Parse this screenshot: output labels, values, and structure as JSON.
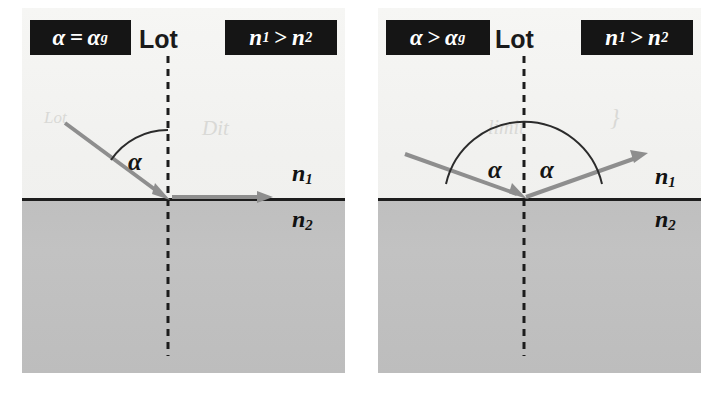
{
  "figure": {
    "background_color": "#ffffff",
    "paper_color": "#f2f2f0",
    "medium2_color": "#c0c0c0",
    "ray_color": "#8e8e8e",
    "badge_bg": "#151515",
    "badge_fg": "#ffffff",
    "ink_color": "#1a1a1a"
  },
  "panels": [
    {
      "id": "left",
      "name": "critical-angle-panel",
      "condition_badge": {
        "symbol": "α",
        "operator": "=",
        "reference": "α",
        "reference_sub": "g",
        "text": "α = αg"
      },
      "index_badge": {
        "left": "n",
        "left_sub": "1",
        "operator": ">",
        "right": "n",
        "right_sub": "2",
        "text": "n1 > n2"
      },
      "normal_label": "Lot",
      "medium_upper_label": "n",
      "medium_upper_sub": "1",
      "medium_lower_label": "n",
      "medium_lower_sub": "2",
      "angle_labels": [
        "α"
      ],
      "rays": [
        {
          "role": "incident-ray",
          "direction": "down-right"
        },
        {
          "role": "refracted-ray-grazing",
          "direction": "right-along-interface"
        }
      ],
      "ghost_text": [
        "Dit",
        "Lot"
      ]
    },
    {
      "id": "right",
      "name": "total-internal-reflection-panel",
      "condition_badge": {
        "symbol": "α",
        "operator": ">",
        "reference": "α",
        "reference_sub": "g",
        "text": "α > αg"
      },
      "index_badge": {
        "left": "n",
        "left_sub": "1",
        "operator": ">",
        "right": "n",
        "right_sub": "2",
        "text": "n1 > n2"
      },
      "normal_label": "Lot",
      "medium_upper_label": "n",
      "medium_upper_sub": "1",
      "medium_lower_label": "n",
      "medium_lower_sub": "2",
      "angle_labels": [
        "α",
        "α"
      ],
      "rays": [
        {
          "role": "incident-ray",
          "direction": "down-right"
        },
        {
          "role": "reflected-ray",
          "direction": "up-right"
        }
      ],
      "ghost_text": [
        "limit",
        "}"
      ]
    }
  ]
}
